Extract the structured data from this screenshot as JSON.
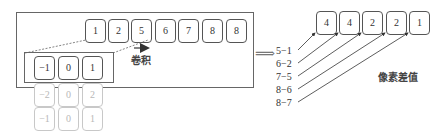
{
  "input_row": {
    "cells": [
      "1",
      "2",
      "5",
      "6",
      "7",
      "8",
      "8"
    ]
  },
  "kernel": {
    "active_row": [
      "−1",
      "0",
      "1"
    ],
    "faded_rows": [
      [
        "−2",
        "0",
        "2"
      ],
      [
        "−1",
        "0",
        "1"
      ]
    ]
  },
  "convolution_label": "卷积",
  "arrow_symbol": "⟹",
  "differences": {
    "expressions": [
      "5−1",
      "6−2",
      "7−5",
      "8−6",
      "8−7"
    ],
    "results": [
      "4",
      "4",
      "2",
      "2",
      "1"
    ],
    "label": "像素差值"
  },
  "colors": {
    "stroke": "#555555",
    "faded": "#c8c8c8",
    "text": "#333333"
  }
}
